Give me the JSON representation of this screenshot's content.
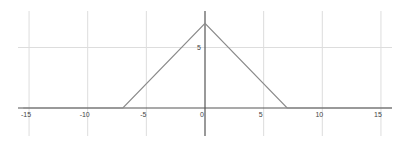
{
  "chart_data": {
    "type": "line",
    "title": "",
    "xlabel": "",
    "ylabel": "",
    "xlim": [
      -15.5,
      16
    ],
    "ylim": [
      -2.3,
      8.0
    ],
    "grid": true,
    "legend": null,
    "x_ticks": [
      -15,
      -10,
      -5,
      0,
      5,
      10,
      15
    ],
    "x_tick_labels": [
      "-15",
      "-10",
      "-5",
      "0",
      "5",
      "10",
      "15"
    ],
    "y_ticks": [
      5
    ],
    "y_tick_labels": [
      "5"
    ],
    "series": [
      {
        "name": "y = max(0, 7 - |x|)",
        "x": [
          -15.5,
          -7,
          0,
          7,
          16
        ],
        "y": [
          0,
          0,
          7,
          0,
          0
        ]
      }
    ]
  },
  "colors": {
    "axis": "#555555",
    "grid": "#dddddd",
    "line": "#8a8a8a",
    "label": "#444444"
  }
}
